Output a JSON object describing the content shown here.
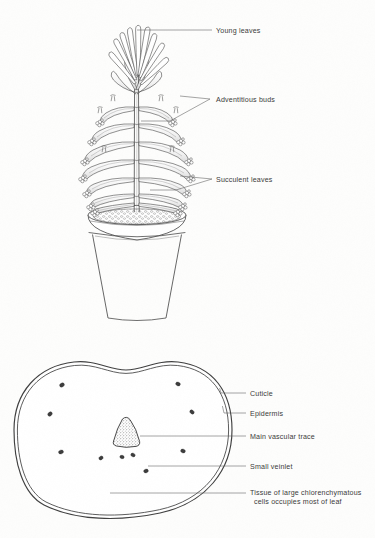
{
  "figure": {
    "background_color": "#fdfdfc",
    "ink_color": "#3a3a3a"
  },
  "panels": [
    {
      "id": "habit",
      "name": "potted-plant-habit",
      "description": "Potted succulent plant with erect central stem, whorls of drooping terete leaves bearing adventitious bud clusters, and an apical crown of young leaves",
      "labels": [
        {
          "id": "young-leaves",
          "text": "Young leaves",
          "x": 216,
          "y": 31,
          "leader": [
            [
              137,
              30
            ],
            [
              212,
              30
            ]
          ]
        },
        {
          "id": "adventitious-buds",
          "text": "Adventitious buds",
          "x": 216,
          "y": 100,
          "leader": [
            [
              180,
              96
            ],
            [
              210,
              99
            ]
          ],
          "fork": [
            [
              210,
              99
            ],
            [
              170,
              121
            ],
            [
              141,
              121
            ]
          ]
        },
        {
          "id": "succulent-leaves",
          "text": "Succulent leaves",
          "x": 216,
          "y": 180,
          "leader": [
            [
              180,
              176
            ],
            [
              212,
              179
            ]
          ],
          "fork": [
            [
              212,
              179
            ],
            [
              176,
              190
            ],
            [
              150,
              190
            ]
          ]
        }
      ]
    },
    {
      "id": "cross-section",
      "name": "leaf-cross-section",
      "description": "Transverse section of a succulent leaf showing cuticle, epidermis, central vascular trace, small veinlets and chlorenchymatous ground tissue",
      "labels": [
        {
          "id": "cuticle",
          "text": "Cuticle",
          "x": 250,
          "y": 395
        },
        {
          "id": "epidermis",
          "text": "Epidermis",
          "x": 250,
          "y": 415
        },
        {
          "id": "main-vascular-trace",
          "text": "Main vascular trace",
          "x": 250,
          "y": 437
        },
        {
          "id": "small-veinlet",
          "text": "Small veinlet",
          "x": 250,
          "y": 467
        },
        {
          "id": "ground-tissue-line1",
          "text": "Tissue of large chlorenchymatous",
          "x": 250,
          "y": 494
        },
        {
          "id": "ground-tissue-line2",
          "text": "cells occupies most of leaf",
          "x": 254,
          "y": 503
        }
      ]
    }
  ]
}
